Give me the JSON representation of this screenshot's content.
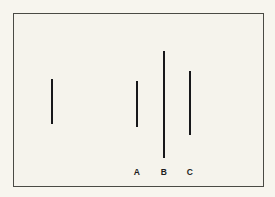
{
  "figure": {
    "name": "line-length-comparison",
    "background_color": "#f5f3ec",
    "page_color": "#f7f5ee",
    "frame": {
      "color": "#4a4a44",
      "x": 13,
      "y": 13,
      "width": 251,
      "height": 174
    },
    "line_color": "#17171a",
    "line_thickness": 2.6
  },
  "chart_data": {
    "type": "bar",
    "title": "",
    "xlabel": "",
    "ylabel": "",
    "orientation": "vertical-lines",
    "categories": [
      "Standard",
      "A",
      "B",
      "C"
    ],
    "values": [
      45,
      46,
      107,
      64
    ],
    "units": "px",
    "grid": false,
    "legend": false
  },
  "lines": [
    {
      "id": "standard",
      "label": "",
      "x": 51,
      "top": 78,
      "bottom": 123,
      "length": 45,
      "labeled": false
    },
    {
      "id": "a",
      "label": "A",
      "x": 136,
      "top": 80,
      "bottom": 126,
      "length": 46,
      "labeled": true
    },
    {
      "id": "b",
      "label": "B",
      "x": 163,
      "top": 50,
      "bottom": 157,
      "length": 107,
      "labeled": true
    },
    {
      "id": "c",
      "label": "C",
      "x": 189,
      "top": 70,
      "bottom": 134,
      "length": 64,
      "labeled": true
    }
  ],
  "labels": {
    "row_y": 166,
    "items": [
      {
        "text": "A",
        "x": 136
      },
      {
        "text": "B",
        "x": 163
      },
      {
        "text": "C",
        "x": 189
      }
    ]
  }
}
